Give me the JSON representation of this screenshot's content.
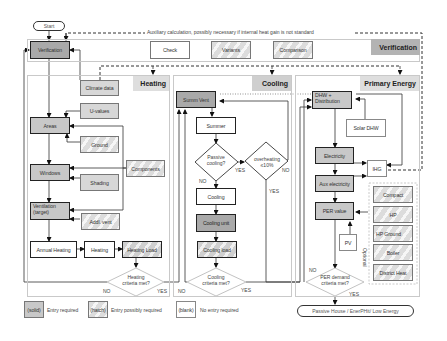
{
  "terminals": {
    "start": "Start",
    "end": "Passive House / EnerPHit/ Low Energy"
  },
  "annotation": {
    "auxiliary": "Auxiliary calculation, possibly necessary if internal heat gain is not standard"
  },
  "sections": {
    "verification": "Verification",
    "heating": "Heating",
    "cooling": "Cooling",
    "primary_energy": "Primary Energy"
  },
  "verification_row": {
    "verification": "Verification",
    "check": "Check",
    "variants": "Variants",
    "comparison": "Comparison"
  },
  "heating": {
    "climate_data": "Climate data",
    "u_values": "U-values",
    "areas": "Areas",
    "ground": "Ground",
    "components": "Components",
    "windows": "Windows",
    "shading": "Shading",
    "ventilation_line1": "Ventilation",
    "ventilation_line2": "(target)",
    "addl_vent": "Addl. vent",
    "annual_heating": "Annual Heating",
    "heating": "Heating",
    "heating_load": "Heating Load",
    "decision_line1": "Heating",
    "decision_line2": "criteria met?",
    "no": "NO",
    "yes": "YES"
  },
  "cooling": {
    "summ_vent": "Summ Vent",
    "summer": "Summer",
    "passive_line1": "Passive",
    "passive_line2": "cooling?",
    "overheating_line1": "overheating",
    "overheating_line2": "≤10%",
    "passive_yes": "YES",
    "passive_no": "NO",
    "overheating_no": "NO",
    "overheating_yes": "YES",
    "cooling": "Cooling",
    "cooling_unit": "Cooling unit",
    "cooling_load": "Cooling load",
    "decision_line1": "Cooling",
    "decision_line2": "criteria met?",
    "no": "NO",
    "yes": "YES"
  },
  "primary_energy": {
    "dhw_line1": "DHW +",
    "dhw_line2": "Distribution",
    "solar_dhw": "Solar DHW",
    "electricity": "Electricity",
    "ihg": "IHG",
    "aux_electricity": "Aux electricity",
    "per_value": "PER value",
    "pv": "PV",
    "optional_label": "Optional",
    "optional_items": [
      "Compact",
      "HP",
      "HP Ground",
      "Boiler",
      "District Heat"
    ],
    "decision_line1": "PER demand",
    "decision_line2": "criteria met?",
    "no": "NO",
    "yes": "YES"
  },
  "legend": {
    "solid_box": "(solid)",
    "solid_text": "Entry required",
    "hatch_box": "(hatch)",
    "hatch_text": "Entry possibly required",
    "blank_box": "(blank)",
    "blank_text": "No entry required"
  },
  "colors": {
    "solid": "#c8c8c8",
    "solid_dark": "#a9a9a9",
    "section_header": "#dedede",
    "line": "#222222"
  }
}
